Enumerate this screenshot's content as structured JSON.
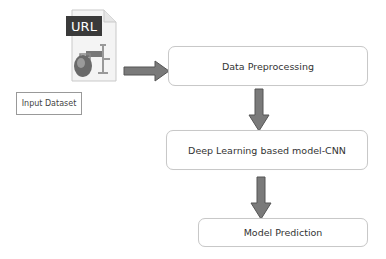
{
  "diagram": {
    "input": {
      "icon": "url-file-icon",
      "icon_text": "URL",
      "label": "Input Dataset"
    },
    "steps": [
      {
        "id": "preprocessing",
        "label": "Data Preprocessing"
      },
      {
        "id": "model",
        "label": "Deep Learning based model-CNN"
      },
      {
        "id": "prediction",
        "label": "Model Prediction"
      }
    ],
    "edges": [
      {
        "from": "input",
        "to": "preprocessing",
        "direction": "right"
      },
      {
        "from": "preprocessing",
        "to": "model",
        "direction": "down"
      },
      {
        "from": "model",
        "to": "prediction",
        "direction": "down"
      }
    ],
    "colors": {
      "arrow_fill": "#7a7a7a",
      "arrow_stroke": "#555555",
      "box_border": "#c8c8c8",
      "url_badge": "#3a3a3a"
    }
  }
}
